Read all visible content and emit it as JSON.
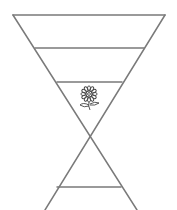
{
  "diagram": {
    "type": "inverted-triangle-with-crossing-legs",
    "stroke_color": "#7a7a7a",
    "background": "#ffffff",
    "top_edge": {
      "x1": 13,
      "y1": 15,
      "x2": 165,
      "y2": 15
    },
    "left_leg": {
      "x1": 13,
      "y1": 15,
      "x2": 137,
      "y2": 210
    },
    "right_leg": {
      "x1": 165,
      "y1": 15,
      "x2": 45,
      "y2": 210
    },
    "horizontal_lines": [
      {
        "x1": 36,
        "y1": 48,
        "x2": 144,
        "y2": 48
      },
      {
        "x1": 59,
        "y1": 82,
        "x2": 122,
        "y2": 82
      },
      {
        "x1": 56,
        "y1": 187,
        "x2": 121,
        "y2": 187
      }
    ],
    "icon": {
      "name": "flower-icon",
      "cx": 89,
      "cy": 95
    }
  }
}
